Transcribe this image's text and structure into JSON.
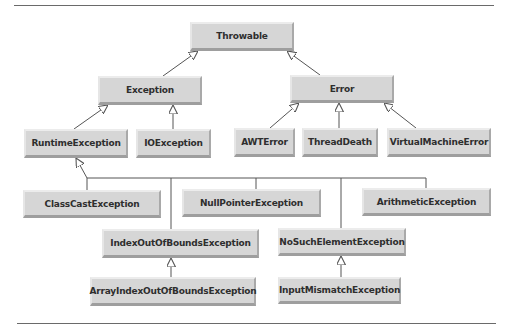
{
  "diagram": {
    "line_color": "#555555",
    "box_color": "#d6d6d6",
    "nodes": {
      "throwable": "Throwable",
      "exception": "Exception",
      "error": "Error",
      "runtime_exception": "RuntimeException",
      "io_exception": "IOException",
      "awt_error": "AWTError",
      "thread_death": "ThreadDeath",
      "virtual_machine_error": "VirtualMachineError",
      "class_cast_exception": "ClassCastException",
      "null_pointer_exception": "NullPointerException",
      "arithmetic_exception": "ArithmeticException",
      "index_out_of_bounds_exception": "IndexOutOfBoundsException",
      "no_such_element_exception": "NoSuchElementException",
      "array_index_out_of_bounds_exception": "ArrayIndexOutOfBoundsException",
      "input_mismatch_exception": "InputMismatchException"
    },
    "edges": [
      {
        "from": "Exception",
        "to": "Throwable"
      },
      {
        "from": "Error",
        "to": "Throwable"
      },
      {
        "from": "RuntimeException",
        "to": "Exception"
      },
      {
        "from": "IOException",
        "to": "Exception"
      },
      {
        "from": "AWTError",
        "to": "Error"
      },
      {
        "from": "ThreadDeath",
        "to": "Error"
      },
      {
        "from": "VirtualMachineError",
        "to": "Error"
      },
      {
        "from": "ClassCastException",
        "to": "RuntimeException"
      },
      {
        "from": "NullPointerException",
        "to": "RuntimeException"
      },
      {
        "from": "ArithmeticException",
        "to": "RuntimeException"
      },
      {
        "from": "IndexOutOfBoundsException",
        "to": "RuntimeException"
      },
      {
        "from": "NoSuchElementException",
        "to": "RuntimeException"
      },
      {
        "from": "ArrayIndexOutOfBoundsException",
        "to": "IndexOutOfBoundsException"
      },
      {
        "from": "InputMismatchException",
        "to": "NoSuchElementException"
      }
    ]
  }
}
